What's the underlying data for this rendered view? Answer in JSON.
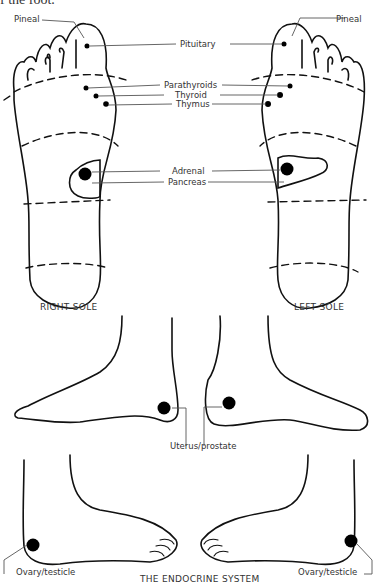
{
  "header_fragment": "f the foot.",
  "title": "THE ENDOCRINE SYSTEM",
  "soles": {
    "right_caption": "RIGHT SOLE",
    "left_caption": "LEFT SOLE"
  },
  "labels": {
    "pineal_left": "Pineal",
    "pineal_right": "Pineal",
    "pituitary": "Pituitary",
    "parathyroids": "Parathyroids",
    "thyroid": "Thyroid",
    "thymus": "Thymus",
    "adrenal": "Adrenal",
    "pancreas": "Pancreas",
    "uterus_prostate": "Uterus/prostate",
    "ovary_testicle_left": "Ovary/testicle",
    "ovary_testicle_right": "Ovary/testicle"
  },
  "colors": {
    "line": "#111111",
    "leader": "#555555",
    "dot": "#000000"
  }
}
